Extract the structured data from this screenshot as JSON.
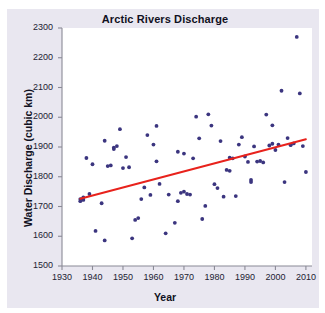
{
  "chart_data": {
    "type": "scatter",
    "title": "Arctic Rivers Discharge",
    "xlabel": "Year",
    "ylabel": "Water Discharge (cubic km)",
    "xlim": [
      1930,
      2012
    ],
    "ylim": [
      1500,
      2300
    ],
    "xticks": [
      1930,
      1940,
      1950,
      1960,
      1970,
      1980,
      1990,
      2000,
      2010
    ],
    "yticks": [
      1500,
      1600,
      1700,
      1800,
      1900,
      2000,
      2100,
      2200,
      2300
    ],
    "grid": false,
    "legend": "none",
    "marker_color": "#3b357f",
    "trendline_color": "#e8221c",
    "panel_background": "#e9e7f0",
    "plot_background": "#ffffff",
    "series": [
      {
        "name": "Annual water discharge",
        "marker": "circle",
        "points": [
          [
            1936,
            1718
          ],
          [
            1936,
            1725
          ],
          [
            1937,
            1731
          ],
          [
            1937,
            1722
          ],
          [
            1938,
            1863
          ],
          [
            1939,
            1742
          ],
          [
            1940,
            1842
          ],
          [
            1941,
            1618
          ],
          [
            1943,
            1711
          ],
          [
            1944,
            1921
          ],
          [
            1944,
            1586
          ],
          [
            1945,
            1836
          ],
          [
            1946,
            1838
          ],
          [
            1947,
            1898
          ],
          [
            1947,
            1893
          ],
          [
            1948,
            1903
          ],
          [
            1949,
            1960
          ],
          [
            1950,
            1829
          ],
          [
            1951,
            1866
          ],
          [
            1952,
            1832
          ],
          [
            1953,
            1593
          ],
          [
            1954,
            1655
          ],
          [
            1955,
            1661
          ],
          [
            1956,
            1725
          ],
          [
            1957,
            1764
          ],
          [
            1958,
            1940
          ],
          [
            1959,
            1739
          ],
          [
            1960,
            1908
          ],
          [
            1961,
            1971
          ],
          [
            1961,
            1852
          ],
          [
            1962,
            1776
          ],
          [
            1964,
            1610
          ],
          [
            1965,
            1740
          ],
          [
            1967,
            1645
          ],
          [
            1968,
            1718
          ],
          [
            1968,
            1884
          ],
          [
            1969,
            1746
          ],
          [
            1970,
            1878
          ],
          [
            1970,
            1750
          ],
          [
            1971,
            1742
          ],
          [
            1972,
            1740
          ],
          [
            1973,
            1862
          ],
          [
            1974,
            2002
          ],
          [
            1975,
            1929
          ],
          [
            1976,
            1658
          ],
          [
            1977,
            1702
          ],
          [
            1978,
            2010
          ],
          [
            1979,
            1972
          ],
          [
            1980,
            1775
          ],
          [
            1981,
            1762
          ],
          [
            1982,
            1920
          ],
          [
            1983,
            1733
          ],
          [
            1984,
            1823
          ],
          [
            1985,
            1820
          ],
          [
            1985,
            1864
          ],
          [
            1986,
            1862
          ],
          [
            1987,
            1735
          ],
          [
            1988,
            1908
          ],
          [
            1989,
            1933
          ],
          [
            1990,
            1868
          ],
          [
            1991,
            1850
          ],
          [
            1992,
            1789
          ],
          [
            1992,
            1782
          ],
          [
            1993,
            1902
          ],
          [
            1994,
            1851
          ],
          [
            1995,
            1853
          ],
          [
            1996,
            1848
          ],
          [
            1997,
            2009
          ],
          [
            1998,
            1905
          ],
          [
            1999,
            1973
          ],
          [
            1999,
            1911
          ],
          [
            2000,
            1890
          ],
          [
            2001,
            1908
          ],
          [
            2002,
            2089
          ],
          [
            2003,
            1782
          ],
          [
            2004,
            1930
          ],
          [
            2005,
            1906
          ],
          [
            2006,
            1912
          ],
          [
            2007,
            2270
          ],
          [
            2008,
            2080
          ],
          [
            2009,
            1903
          ],
          [
            2010,
            1816
          ]
        ]
      }
    ],
    "trendline": {
      "name": "Linear trend",
      "x_start": 1936,
      "y_start": 1726,
      "x_end": 2010,
      "y_end": 1926
    }
  }
}
